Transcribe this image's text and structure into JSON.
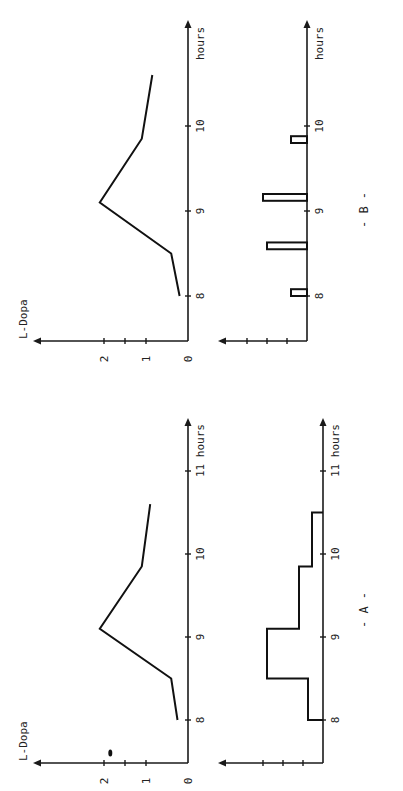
{
  "figure": {
    "panels": [
      {
        "id": "A",
        "caption": "- A -"
      },
      {
        "id": "B",
        "caption": "- B -"
      }
    ]
  },
  "chart_data": [
    {
      "panel": "A",
      "name": "A-concentration",
      "type": "line",
      "title": "",
      "xlabel": "hours",
      "ylabel": "L-Dopa",
      "xticks": [
        "8",
        "9",
        "10",
        "11 hours"
      ],
      "yticks": [
        "0",
        "1",
        "2"
      ],
      "xlim": [
        7.5,
        11.3
      ],
      "ylim": [
        0,
        2.3
      ],
      "x": [
        8.0,
        8.5,
        9.1,
        9.85,
        10.6
      ],
      "y": [
        0.25,
        0.4,
        2.1,
        1.1,
        0.9
      ],
      "annotation": "•"
    },
    {
      "panel": "A",
      "name": "A-infusion",
      "type": "line",
      "subtype": "step",
      "xlabel": "hours",
      "xticks": [
        "8",
        "9",
        "10",
        "11 hours"
      ],
      "xlim": [
        7.5,
        11.3
      ],
      "ylim": [
        0,
        4
      ],
      "steps": [
        {
          "start": 8.0,
          "end": 8.5,
          "level": 0.75
        },
        {
          "start": 8.5,
          "end": 9.1,
          "level": 2.8
        },
        {
          "start": 9.1,
          "end": 9.85,
          "level": 1.2
        },
        {
          "start": 9.85,
          "end": 10.5,
          "level": 0.55
        }
      ]
    },
    {
      "panel": "B",
      "name": "B-concentration",
      "type": "line",
      "title": "",
      "xlabel": "hours",
      "ylabel": "L-Dopa",
      "xticks": [
        "8",
        "9",
        "10",
        "hours"
      ],
      "yticks": [
        "0",
        "1",
        "2"
      ],
      "xlim": [
        7.5,
        11.3
      ],
      "ylim": [
        0,
        2.3
      ],
      "x": [
        8.0,
        8.5,
        9.1,
        9.85,
        10.6
      ],
      "y": [
        0.2,
        0.4,
        2.1,
        1.1,
        0.85
      ]
    },
    {
      "panel": "B",
      "name": "B-infusion",
      "type": "bar",
      "xlabel": "hours",
      "xticks": [
        "8",
        "9",
        "10",
        "hours"
      ],
      "xlim": [
        7.5,
        11.3
      ],
      "ylim": [
        0,
        4
      ],
      "bars": [
        {
          "start": 8.0,
          "end": 8.08,
          "level": 0.8
        },
        {
          "start": 8.55,
          "end": 8.63,
          "level": 2.0
        },
        {
          "start": 9.12,
          "end": 9.2,
          "level": 2.2
        },
        {
          "start": 9.8,
          "end": 9.88,
          "level": 0.8
        }
      ]
    }
  ]
}
